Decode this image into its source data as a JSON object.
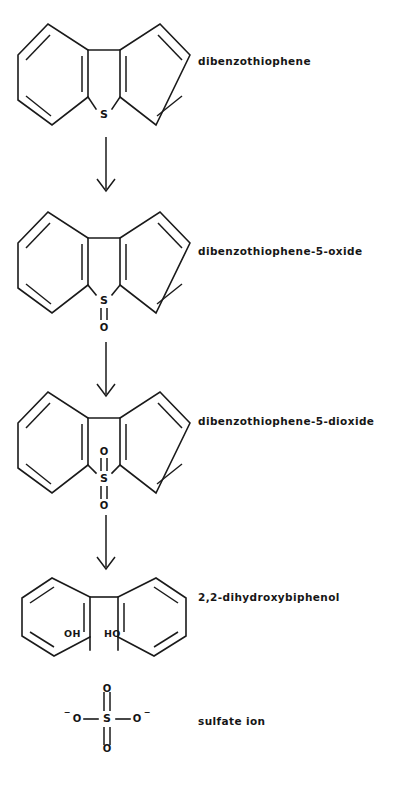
{
  "diagram": {
    "background_color": "#ffffff",
    "ink_color": "#1a1a1a"
  },
  "steps": [
    {
      "id": "dibenzothiophene",
      "label": "dibenzothiophene",
      "structure": "tricyclic-dibenzothiophene",
      "heteroatom": "S",
      "oxygens": 0,
      "label_x": 198,
      "label_y": 62
    },
    {
      "id": "dibenzothiophene-5-oxide",
      "label": "dibenzothiophene-5-oxide",
      "structure": "tricyclic-dibenzothiophene",
      "heteroatom": "S",
      "oxygens": 1,
      "label_x": 198,
      "label_y": 252
    },
    {
      "id": "dibenzothiophene-5-dioxide",
      "label": "dibenzothiophene-5-dioxide",
      "structure": "tricyclic-dibenzothiophene",
      "heteroatom": "S",
      "oxygens": 2,
      "label_x": 198,
      "label_y": 422
    },
    {
      "id": "2-2-dihydroxybiphenol",
      "label": "2,2-dihydroxybiphenol",
      "structure": "biphenyl-diol",
      "heteroatom": "",
      "oxygens": 0,
      "label_x": 198,
      "label_y": 598
    },
    {
      "id": "sulfate-ion",
      "label": "sulfate ion",
      "structure": "sulfate",
      "heteroatom": "S",
      "oxygens": 4,
      "label_x": 198,
      "label_y": 722
    }
  ],
  "arrows": [
    {
      "id": "arrow-1",
      "from": "dibenzothiophene",
      "to": "dibenzothiophene-5-oxide"
    },
    {
      "id": "arrow-2",
      "from": "dibenzothiophene-5-oxide",
      "to": "dibenzothiophene-5-dioxide"
    },
    {
      "id": "arrow-3",
      "from": "dibenzothiophene-5-dioxide",
      "to": "2-2-dihydroxybiphenol"
    }
  ],
  "atoms": {
    "sulfur": "S",
    "oxygen": "O",
    "hydroxyl_left": "OH",
    "hydroxyl_right": "HO",
    "minus": "−"
  }
}
